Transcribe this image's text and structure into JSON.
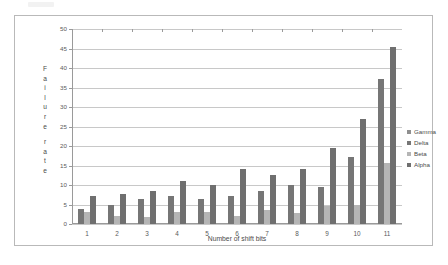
{
  "chart_data": {
    "type": "bar",
    "title": "",
    "xlabel": "Number of shift bits",
    "ylabel": "Failure rate",
    "categories": [
      "1",
      "2",
      "3",
      "4",
      "5",
      "6",
      "7",
      "8",
      "9",
      "10",
      "11"
    ],
    "ylim": [
      0,
      50
    ],
    "ytick_step": 5,
    "yticks": [
      "0",
      "5",
      "10",
      "15",
      "20",
      "25",
      "30",
      "35",
      "40",
      "45",
      "50"
    ],
    "grid": true,
    "legend_position": "right",
    "series": [
      {
        "name": "Gamma",
        "color": "#8f8f8f",
        "values": [
          0,
          0,
          0,
          0,
          0,
          0,
          0,
          0,
          0,
          0,
          0
        ]
      },
      {
        "name": "Delta",
        "color": "#767676",
        "values": [
          3.8,
          4.9,
          6.4,
          7.3,
          6.3,
          7.3,
          8.4,
          10.0,
          9.5,
          17.3,
          37.1
        ]
      },
      {
        "name": "Beta",
        "color": "#b5b5b5",
        "values": [
          3.2,
          2.0,
          1.9,
          3.0,
          3.1,
          2.1,
          3.6,
          2.8,
          4.7,
          5.0,
          15.6
        ]
      },
      {
        "name": "Alpha",
        "color": "#6f6f6f",
        "values": [
          7.3,
          7.8,
          8.4,
          11.0,
          10.0,
          14.2,
          12.5,
          14.1,
          19.4,
          26.8,
          45.4
        ]
      }
    ]
  },
  "ylabel_chars": [
    "F",
    "a",
    "i",
    "l",
    "u",
    "r",
    "e",
    "",
    "r",
    "a",
    "t",
    "e"
  ],
  "legend": {
    "items": [
      {
        "label": "Gamma"
      },
      {
        "label": "Delta"
      },
      {
        "label": "Beta"
      },
      {
        "label": "Alpha"
      }
    ]
  }
}
